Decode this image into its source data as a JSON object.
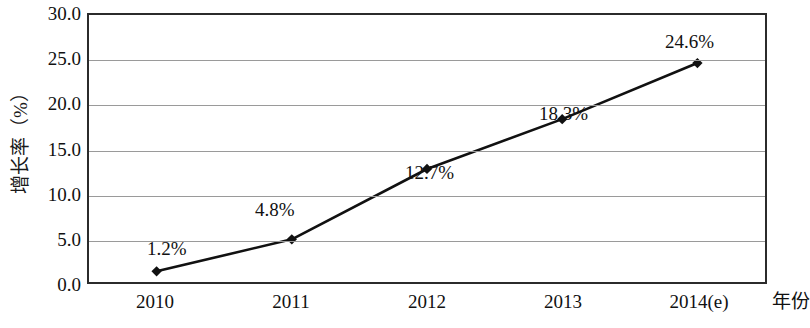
{
  "chart_data": {
    "type": "line",
    "title": "",
    "subtitle": "",
    "xlabel": "年份",
    "ylabel": "增长率（%）",
    "categories": [
      "2010",
      "2011",
      "2012",
      "2013",
      "2014(e)"
    ],
    "values": [
      1.2,
      4.8,
      12.7,
      18.3,
      24.6
    ],
    "point_labels": [
      "1.2%",
      "4.8%",
      "12.7%",
      "18.3%",
      "24.6%"
    ],
    "series": [
      {
        "name": "增长率",
        "values": [
          1.2,
          4.8,
          12.7,
          18.3,
          24.6
        ],
        "color": "#111111",
        "marker": "diamond"
      }
    ],
    "ylim": [
      0.0,
      30.0
    ],
    "ytick_values": [
      30.0,
      25.0,
      20.0,
      15.0,
      10.0,
      5.0,
      0.0
    ],
    "ytick_labels": [
      "30.0",
      "25.0",
      "20.0",
      "15.0",
      "10.0",
      "5.0",
      "0.0"
    ],
    "grid": true,
    "grid_color": "#9a9a9a",
    "legend": "none",
    "frame_color": "#2b2b2b",
    "background": "#ffffff",
    "label_positions": [
      {
        "label": "1.2%",
        "left": 60,
        "top": 239
      },
      {
        "label": "4.8%",
        "left": 168,
        "top": 200
      },
      {
        "label": "12.7%",
        "left": 318,
        "top": 163
      },
      {
        "label": "18.3%",
        "left": 452,
        "top": 104
      },
      {
        "label": "24.6%",
        "left": 578,
        "top": 32
      }
    ]
  }
}
